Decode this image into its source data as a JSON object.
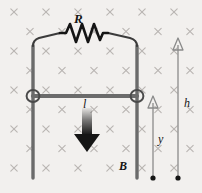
{
  "figure": {
    "background_color": "#f2f0ee",
    "wire_color": "#6b6b6b",
    "ink_color": "#151515",
    "field_mark_color": "#b9b5b2"
  },
  "labels": {
    "resistor": "R",
    "current": "l",
    "field": "B",
    "height": "h",
    "position": "y"
  },
  "icons": {
    "field_mark": "x-mark-into-page",
    "force_arrow": "down-arrow",
    "dimension_arrow": "up-arrow-head",
    "contact_ring": "ring-contact",
    "terminal_dot": "filled-dot"
  },
  "field_marks": {
    "symbol": "×",
    "rows": 9,
    "description": "staggered grid of x symbols representing magnetic field into the page",
    "x_start_even": 14,
    "x_start_odd": 30,
    "x_step": 32,
    "y_start": 12,
    "y_step": 19.5
  },
  "geometry": {
    "left_rail_x": 33,
    "right_rail_x": 137,
    "rail_top_y": 42,
    "rail_bottom_y": 178,
    "crossbar_y": 96,
    "resistor_y": 38,
    "resistor_left_x": 60,
    "resistor_right_x": 108,
    "arrow_x": 87,
    "arrow_top_y": 108,
    "arrow_bottom_y": 150,
    "h_line_x": 178,
    "h_top_y": 40,
    "h_bottom_y": 178,
    "y_line_x": 153,
    "y_top_y": 96,
    "y_bottom_y": 178
  }
}
